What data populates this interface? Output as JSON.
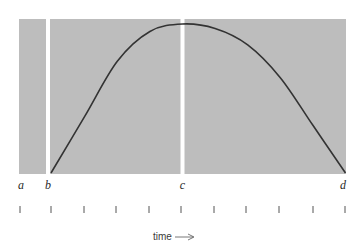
{
  "diagram": {
    "type": "time-curve",
    "colors": {
      "panel": "#bdbdbd",
      "divider": "#ffffff",
      "curve": "#333333",
      "tick": "#555555",
      "text": "#2a2a2a"
    },
    "markers": [
      {
        "id": "a",
        "label": "a",
        "t": 0
      },
      {
        "id": "b",
        "label": "b",
        "t": 1
      },
      {
        "id": "c",
        "label": "c",
        "t": 5
      },
      {
        "id": "d",
        "label": "d",
        "t": 10
      }
    ],
    "tick_count": 11,
    "curve": {
      "description": "rise from b to a peak near c, then fall to d",
      "points": [
        {
          "t": 1,
          "v": 0.0
        },
        {
          "t": 2,
          "v": 0.38
        },
        {
          "t": 3,
          "v": 0.75
        },
        {
          "t": 4,
          "v": 0.95
        },
        {
          "t": 5,
          "v": 1.0
        },
        {
          "t": 6,
          "v": 0.97
        },
        {
          "t": 7,
          "v": 0.86
        },
        {
          "t": 8,
          "v": 0.64
        },
        {
          "t": 9,
          "v": 0.32
        },
        {
          "t": 10,
          "v": 0.0
        }
      ]
    },
    "axis_label": "time"
  }
}
